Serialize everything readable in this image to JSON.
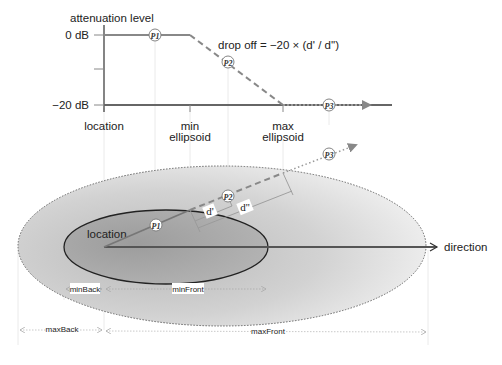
{
  "chart": {
    "y_axis_title": "attenuation level",
    "y_ticks": [
      "0 dB",
      "−20 dB"
    ],
    "x_ticks": [
      "location",
      "min",
      "ellipsoid",
      "max",
      "ellipsoid"
    ],
    "formula": "drop off = −20 × (d' / d'')",
    "points": [
      "P1",
      "P2",
      "P3"
    ]
  },
  "ellipse": {
    "location_label": "location",
    "direction_label": "direction",
    "points": [
      "P1",
      "P2",
      "P3"
    ],
    "d_prime": "d'",
    "d_double_prime": "d''",
    "dimensions": {
      "min_back": "minBack",
      "min_front": "minFront",
      "max_back": "maxBack",
      "max_front": "maxFront"
    }
  },
  "colors": {
    "line": "#7a7a7a",
    "axis": "#333333",
    "inner_fill": "#a8a8a8",
    "outer_fill": "#d8d8d8"
  }
}
